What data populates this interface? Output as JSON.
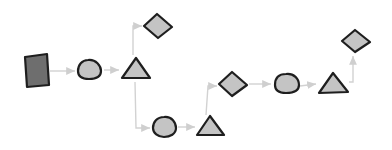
{
  "diagram": {
    "title": "",
    "style": "hand-drawn flow",
    "colors": {
      "background": "#ffffff",
      "shape_fill": "#c4c4c4",
      "square_fill": "#6e6e6e",
      "stroke": "#1e1e1e",
      "edge": "#d2d2d2",
      "arrowhead": "#cfcfcf"
    },
    "nodes": [
      {
        "id": "n1",
        "shape": "square",
        "label": ""
      },
      {
        "id": "n2",
        "shape": "circle",
        "label": ""
      },
      {
        "id": "n3",
        "shape": "triangle",
        "label": ""
      },
      {
        "id": "n4",
        "shape": "diamond",
        "label": ""
      },
      {
        "id": "n5",
        "shape": "circle",
        "label": ""
      },
      {
        "id": "n6",
        "shape": "triangle",
        "label": ""
      },
      {
        "id": "n7",
        "shape": "diamond",
        "label": ""
      },
      {
        "id": "n8",
        "shape": "circle",
        "label": ""
      },
      {
        "id": "n9",
        "shape": "triangle",
        "label": ""
      },
      {
        "id": "n10",
        "shape": "diamond",
        "label": ""
      }
    ],
    "edges": [
      {
        "from": "n1",
        "to": "n2"
      },
      {
        "from": "n2",
        "to": "n3"
      },
      {
        "from": "n3",
        "to": "n4"
      },
      {
        "from": "n3",
        "to": "n5"
      },
      {
        "from": "n5",
        "to": "n6"
      },
      {
        "from": "n6",
        "to": "n7"
      },
      {
        "from": "n7",
        "to": "n8"
      },
      {
        "from": "n8",
        "to": "n9"
      },
      {
        "from": "n9",
        "to": "n10"
      }
    ]
  }
}
